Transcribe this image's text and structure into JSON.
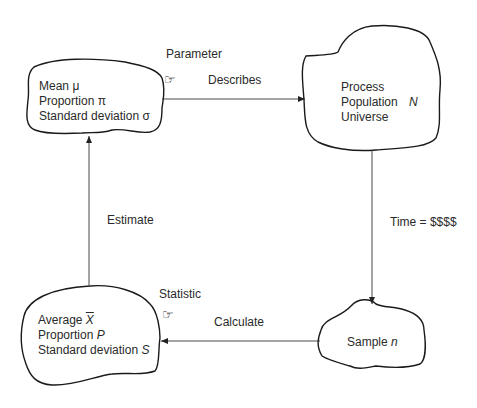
{
  "diagram": {
    "nodes": {
      "parameter": {
        "lines": [
          {
            "text": "Mean",
            "symbol": "μ",
            "symbol_italic": false
          },
          {
            "text": "Proportion",
            "symbol": "π",
            "symbol_italic": false
          },
          {
            "text": "Standard deviation",
            "symbol": "σ",
            "symbol_italic": false
          }
        ]
      },
      "population": {
        "lines": [
          {
            "text": "Process",
            "symbol": ""
          },
          {
            "text": "Population",
            "symbol": "N",
            "symbol_italic": true
          },
          {
            "text": "Universe",
            "symbol": ""
          }
        ]
      },
      "statistic": {
        "lines": [
          {
            "text": "Average",
            "symbol": "X",
            "symbol_italic": true,
            "overbar": true
          },
          {
            "text": "Proportion",
            "symbol": "P",
            "symbol_italic": true
          },
          {
            "text": "Standard deviation",
            "symbol": "S",
            "symbol_italic": true
          }
        ]
      },
      "sample": {
        "lines": [
          {
            "text": "Sample",
            "symbol": "n",
            "symbol_italic": true
          }
        ]
      }
    },
    "annotations": {
      "parameter_label": "Parameter",
      "statistic_label": "Statistic",
      "hand_icon": "☞"
    },
    "edges": [
      {
        "from": "parameter",
        "to": "population",
        "label": "Describes"
      },
      {
        "from": "population",
        "to": "sample",
        "label": "Time = $$$$"
      },
      {
        "from": "sample",
        "to": "statistic",
        "label": "Calculate"
      },
      {
        "from": "statistic",
        "to": "parameter",
        "label": "Estimate"
      }
    ],
    "colors": {
      "stroke": "#1a1a1a",
      "arrow": "#333333",
      "text": "#2a2a2a"
    }
  }
}
